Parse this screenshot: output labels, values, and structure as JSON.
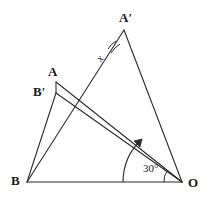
{
  "figure": {
    "type": "geometry-diagram",
    "width": 209,
    "height": 205,
    "background_color": "#ffffff",
    "stroke_color": "#2b2b2b"
  },
  "points": [
    {
      "id": "B",
      "label": "B",
      "x": 27,
      "y": 182,
      "label_dx": -16,
      "label_dy": -8
    },
    {
      "id": "O",
      "label": "O",
      "x": 182,
      "y": 182,
      "label_dx": 6,
      "label_dy": -6
    },
    {
      "id": "Aprime",
      "label": "A′",
      "x": 124,
      "y": 30,
      "label_dx": -5,
      "label_dy": -18
    },
    {
      "id": "A",
      "label": "A",
      "x": 56,
      "y": 82,
      "label_dx": -7,
      "label_dy": -17
    },
    {
      "id": "Bprime",
      "label": "B′",
      "x": 56,
      "y": 93,
      "label_dx": -20,
      "label_dy": -8
    }
  ],
  "segments": [
    {
      "id": "B-O",
      "from": "B",
      "to": "O",
      "name": "segment-b-o"
    },
    {
      "id": "B-Aprime",
      "from": "B",
      "to": "Aprime",
      "name": "segment-b-a-prime"
    },
    {
      "id": "Aprime-O",
      "from": "Aprime",
      "to": "O",
      "name": "segment-a-prime-o"
    },
    {
      "id": "B-Bprime",
      "from": "B",
      "to": "Bprime",
      "name": "segment-b-b-prime"
    },
    {
      "id": "O-A",
      "from": "O",
      "to": "A",
      "name": "segment-o-a"
    },
    {
      "id": "O-Bprime",
      "from": "O",
      "to": "Bprime",
      "name": "segment-o-b-prime"
    },
    {
      "id": "A-Bprime",
      "from": "A",
      "to": "Bprime",
      "name": "segment-a-b-prime"
    }
  ],
  "angles": [
    {
      "id": "angle-x",
      "label": "x",
      "vertex": "Aprime",
      "description": "angle at A-prime between A'B and A'A lines",
      "label_x": 92,
      "label_y": 56
    },
    {
      "id": "angle-30",
      "label": "30°",
      "vertex": "O",
      "description": "rotation angle at O measured from OB to OA",
      "label_x": 145,
      "label_y": 167
    }
  ],
  "markers": {
    "rotation_arrow": {
      "name": "rotation-arrow",
      "description": "curved arrow at O indicating rotation direction",
      "arrowhead": true
    },
    "angle_arc_small": {
      "name": "angle-arc-small",
      "description": "small arc at O marking the 30 degree angle"
    },
    "angle_arc_x": {
      "name": "angle-arc-x",
      "description": "double arc at A-prime marking angle x"
    }
  }
}
